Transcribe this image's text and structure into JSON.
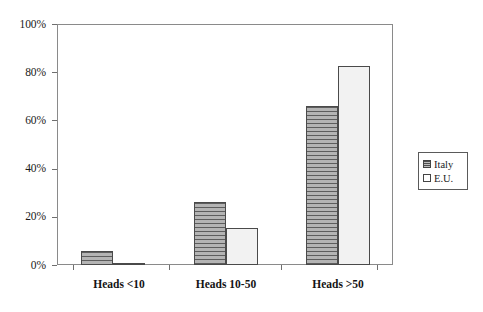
{
  "chart_data": {
    "type": "bar",
    "title": "",
    "subtitle": "",
    "xlabel": "",
    "ylabel": "",
    "categories": [
      "Heads <10",
      "Heads 10-50",
      "Heads >50"
    ],
    "series": [
      {
        "name": "Italy",
        "values": [
          6,
          26,
          66
        ]
      },
      {
        "name": "E.U.",
        "values": [
          1,
          15.5,
          82.5
        ]
      }
    ],
    "ylim": [
      0,
      100
    ],
    "ytick_values": [
      0,
      20,
      40,
      60,
      80,
      100
    ],
    "ytick_labels": [
      "0%",
      "20%",
      "40%",
      "60%",
      "80%",
      "100%"
    ],
    "grid": false,
    "legend_position": "right-outside",
    "value_suffix": "%"
  },
  "legend": {
    "entries": [
      {
        "label": "Italy",
        "swatch": "hatched-gray-swatch"
      },
      {
        "label": "E.U.",
        "swatch": "white-swatch"
      }
    ]
  },
  "colors": {
    "italy_fill": "#a6a6a6",
    "italy_hatch": "#5d5d5d",
    "eu_fill": "#f2f2f2",
    "bar_border": "#4a4a4a",
    "axis": "#8a8a8a",
    "text": "#1a1a1a"
  }
}
